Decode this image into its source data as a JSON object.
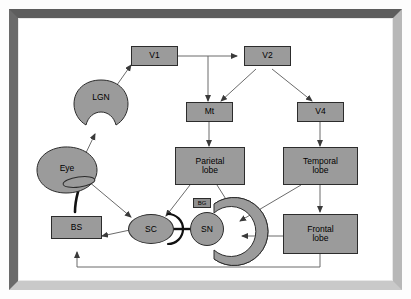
{
  "figure": {
    "background": "#ffffff",
    "node_fill": "#9b9b9b",
    "node_stroke": "#2c2c2c",
    "edge_color": "#555555",
    "frame_color": "#6a6a6a"
  },
  "nodes": {
    "v1": {
      "label": "V1",
      "shape": "box"
    },
    "v2": {
      "label": "V2",
      "shape": "box"
    },
    "mt": {
      "label": "Mt",
      "shape": "box"
    },
    "v4": {
      "label": "V4",
      "shape": "box"
    },
    "parietal": {
      "label": "Parietal\nlobe",
      "line1": "Parietal",
      "line2": "lobe",
      "shape": "box"
    },
    "temporal": {
      "label": "Temporal\nlobe",
      "line1": "Temporal",
      "line2": "lobe",
      "shape": "box"
    },
    "frontal": {
      "label": "Frontal\nlobe",
      "line1": "Frontal",
      "line2": "lobe",
      "shape": "box"
    },
    "lgn": {
      "label": "LGN",
      "shape": "notched-ellipse"
    },
    "eye": {
      "label": "Eye",
      "shape": "blob-ellipse"
    },
    "muscle": {
      "label": "",
      "shape": "small-ellipse"
    },
    "bs": {
      "label": "BS",
      "shape": "box"
    },
    "sc": {
      "label": "SC",
      "shape": "ellipse"
    },
    "sn": {
      "label": "SN",
      "shape": "circle"
    },
    "bg": {
      "label": "BG",
      "shape": "arc-c-shape"
    }
  },
  "edges": [
    {
      "from": "lgn",
      "to": "v1",
      "type": "arrow"
    },
    {
      "from": "v1",
      "to": "v2",
      "type": "arrow"
    },
    {
      "from": "v1",
      "to": "mt",
      "type": "arrow"
    },
    {
      "from": "v2",
      "to": "mt",
      "type": "arrow"
    },
    {
      "from": "v2",
      "to": "v4",
      "type": "arrow"
    },
    {
      "from": "mt",
      "to": "parietal",
      "type": "arrow"
    },
    {
      "from": "v4",
      "to": "temporal",
      "type": "arrow"
    },
    {
      "from": "temporal",
      "to": "frontal",
      "type": "arrow"
    },
    {
      "from": "temporal",
      "to": "bg",
      "type": "arrow"
    },
    {
      "from": "frontal",
      "to": "bg",
      "type": "arrow"
    },
    {
      "from": "parietal",
      "to": "sc",
      "type": "arrow"
    },
    {
      "from": "parietal",
      "to": "bg",
      "type": "arrow"
    },
    {
      "from": "eye",
      "to": "lgn",
      "type": "arrow"
    },
    {
      "from": "eye",
      "to": "sc",
      "type": "arrow"
    },
    {
      "from": "eye",
      "to": "muscle",
      "type": "plain"
    },
    {
      "from": "muscle",
      "to": "bs",
      "type": "thick"
    },
    {
      "from": "sc",
      "to": "bs",
      "type": "arrow"
    },
    {
      "from": "sn",
      "to": "sc",
      "type": "inhibitory"
    },
    {
      "from": "frontal",
      "to": "bs",
      "type": "arrow-feedback"
    }
  ]
}
